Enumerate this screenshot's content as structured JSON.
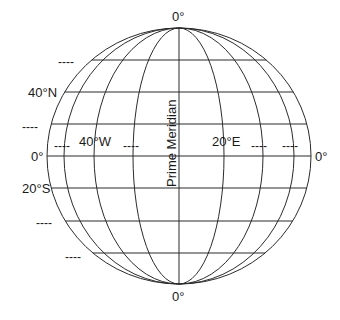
{
  "diagram": {
    "type": "globe-grid",
    "stroke_color": "#2b2b2b",
    "background": "#ffffff",
    "globe": {
      "center_x": 179,
      "center_y": 156,
      "radius_x": 132,
      "radius_y": 128
    },
    "meridian_offsets": [
      -115,
      -85,
      -46,
      0,
      45,
      84,
      115
    ],
    "parallel_ys": [
      60,
      92,
      124,
      156,
      188,
      221,
      253
    ]
  },
  "labels": {
    "top_pole": "0°",
    "bottom_pole": "0°",
    "equator_left": "0°",
    "equator_right": "0°",
    "lat_40n": "40°N",
    "lat_20s": "20°S",
    "lon_40w": "40°W",
    "lon_20e": "20°E",
    "prime_meridian": "Prime Meridian",
    "blank": "----"
  },
  "blanks": [
    {
      "id": "blank-lat-60n",
      "x": 58,
      "y": 56
    },
    {
      "id": "blank-lat-20n",
      "x": 22,
      "y": 121
    },
    {
      "id": "blank-lon-60w",
      "x": 54,
      "y": 140
    },
    {
      "id": "blank-lon-20w",
      "x": 123,
      "y": 140
    },
    {
      "id": "blank-lon-40e",
      "x": 251,
      "y": 140
    },
    {
      "id": "blank-lon-60e",
      "x": 282,
      "y": 140
    },
    {
      "id": "blank-lat-40s",
      "x": 36,
      "y": 217
    },
    {
      "id": "blank-lat-60s",
      "x": 65,
      "y": 251
    }
  ]
}
